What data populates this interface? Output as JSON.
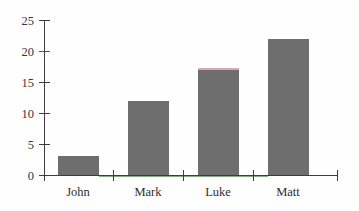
{
  "chart_data": {
    "type": "bar",
    "title": "",
    "subtitle": "",
    "xlabel": "",
    "ylabel": "",
    "categories": [
      "John",
      "Mark",
      "Luke",
      "Matt"
    ],
    "values": [
      3,
      12,
      17,
      22
    ],
    "ylim": [
      0,
      25
    ],
    "yticks": [
      0,
      5,
      10,
      15,
      20,
      25
    ],
    "ytick_labels": [
      "0",
      "5",
      "10",
      "15",
      "20",
      "25"
    ],
    "grid": false,
    "legend": null,
    "legend_position": "none",
    "annotations": [],
    "colors": {
      "bar_fill": "#6e6e6e",
      "bar_top_edge_luke": "#d9a8b5",
      "axis": "#403a42",
      "x_axis_tint": "#5f8f5f",
      "background": "#fefefe",
      "label_text": "#2f2a33"
    }
  }
}
